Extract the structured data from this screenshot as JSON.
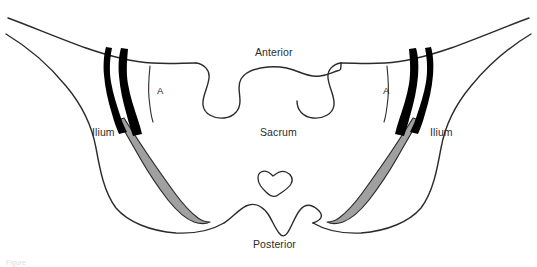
{
  "figure": {
    "type": "anatomical-line-drawing",
    "background_color": "#ffffff",
    "outline_color": "#2b2b2b",
    "ligament_fill_color": "#000000",
    "joint_fill_color": "#a0a0a0",
    "caption_text": "Figure"
  },
  "labels": {
    "anterior": "Anterior",
    "posterior": "Posterior",
    "sacrum": "Sacrum",
    "ilium_left": "Ilium",
    "ilium_right": "Ilium",
    "marker_a_left": "A",
    "marker_a_right": "A"
  },
  "structures": [
    {
      "name": "sacrum",
      "label": "Sacrum",
      "fill": "none"
    },
    {
      "name": "ilium-left",
      "label": "Ilium",
      "fill": "none"
    },
    {
      "name": "ilium-right",
      "label": "Ilium",
      "fill": "none"
    },
    {
      "name": "sacroiliac-joint-left",
      "label": "A",
      "fill": "#000000"
    },
    {
      "name": "sacroiliac-joint-right",
      "label": "A",
      "fill": "#000000"
    },
    {
      "name": "synovial-joint-left",
      "label": "",
      "fill": "#a0a0a0"
    },
    {
      "name": "synovial-joint-right",
      "label": "",
      "fill": "#a0a0a0"
    },
    {
      "name": "sacral-foramen",
      "label": "",
      "fill": "none"
    }
  ]
}
